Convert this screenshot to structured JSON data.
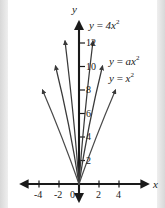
{
  "chart_data": {
    "type": "line",
    "title": "",
    "xlabel": "x",
    "ylabel": "y",
    "xlim": [
      -5.5,
      6.5
    ],
    "ylim": [
      -1.2,
      14
    ],
    "grid": false,
    "legend": "inline-curve-labels",
    "xticks": [
      "-4",
      "-2",
      "0",
      "2",
      "4"
    ],
    "xtick_values": [
      -4,
      -2,
      0,
      2,
      4
    ],
    "yticks": [
      "2",
      "4",
      "6",
      "8",
      "10",
      "12"
    ],
    "ytick_values": [
      2,
      4,
      6,
      8,
      10,
      12
    ],
    "series": [
      {
        "name": "y = 4x^2",
        "label_html": "y <span class=\"op\">=</span> 4x<sup>2</sup>",
        "coefficient": 4,
        "color": "#3a3a3a",
        "x": [
          -1.78,
          -1.5,
          -1.25,
          -1.0,
          -0.75,
          -0.5,
          -0.25,
          0,
          0.25,
          0.5,
          0.75,
          1.0,
          1.25,
          1.5,
          1.78
        ],
        "y": [
          12.7,
          9.0,
          6.25,
          4.0,
          2.25,
          1.0,
          0.25,
          0,
          0.25,
          1.0,
          2.25,
          4.0,
          6.25,
          9.0,
          12.7
        ]
      },
      {
        "name": "y = ax^2",
        "label_html": "y <span class=\"op\">=</span> ax<sup>2</sup>",
        "coefficient": 2,
        "color": "#3a3a3a",
        "x": [
          -2.4,
          -2.0,
          -1.5,
          -1.0,
          -0.5,
          0,
          0.5,
          1.0,
          1.5,
          2.0,
          2.4
        ],
        "y": [
          11.5,
          8.0,
          4.5,
          2.0,
          0.5,
          0,
          0.5,
          2.0,
          4.5,
          8.0,
          11.5
        ]
      },
      {
        "name": "y = x^2",
        "label_html": "y <span class=\"op\">=</span> x<sup>2</sup>",
        "coefficient": 1,
        "color": "#4a4a4a",
        "x": [
          -3.1,
          -2.5,
          -2.0,
          -1.5,
          -1.0,
          -0.5,
          0,
          0.5,
          1.0,
          1.5,
          2.0,
          2.5,
          3.1
        ],
        "y": [
          9.6,
          6.25,
          4.0,
          2.25,
          1.0,
          0.25,
          0,
          0.25,
          1.0,
          2.25,
          4.0,
          6.25,
          9.6
        ]
      }
    ],
    "annotations": [
      {
        "text": "y = 4x^2",
        "at": [
          2.0,
          13.2
        ]
      },
      {
        "text": "y = ax^2",
        "at": [
          3.3,
          10.9
        ]
      },
      {
        "text": "y = x^2",
        "at": [
          3.3,
          9.2
        ]
      }
    ]
  },
  "axes": {
    "y_axis_label": "y",
    "x_axis_label": "x",
    "origin_label": "0"
  },
  "xticks": [
    {
      "label": "-4",
      "value": -4
    },
    {
      "label": "-2",
      "value": -2
    },
    {
      "label": "0",
      "value": 0
    },
    {
      "label": "2",
      "value": 2
    },
    {
      "label": "4",
      "value": 4
    }
  ],
  "yticks": [
    {
      "label": "12",
      "value": 12
    },
    {
      "label": "10",
      "value": 10
    },
    {
      "label": "8",
      "value": 8
    },
    {
      "label": "6",
      "value": 6
    },
    {
      "label": "4",
      "value": 4
    },
    {
      "label": "2",
      "value": 2
    }
  ],
  "colors": {
    "paper": "#ffffff",
    "page_edge": "#d8d8d8",
    "axis": "#1a1a1a",
    "curve": "#3a3a3a",
    "text": "#1a1a1a"
  }
}
